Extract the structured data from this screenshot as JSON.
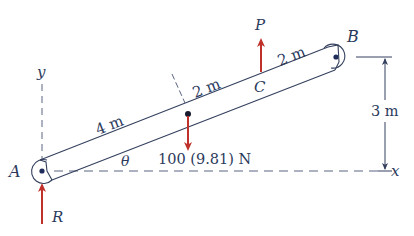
{
  "diagram": {
    "type": "free-body / statics problem figure",
    "colors": {
      "line": "#34405e",
      "force": "#c0312b",
      "dashed": "#5a6480",
      "background": "#ffffff"
    },
    "points": {
      "A": "A",
      "B": "B",
      "C": "C"
    },
    "axes": {
      "x": "x",
      "y": "y"
    },
    "angle": "θ",
    "dimensions": {
      "segment_1": "4 m",
      "segment_2": "2 m",
      "segment_3": "2 m",
      "height": "3 m"
    },
    "forces": {
      "P": "P",
      "R": "R",
      "weight": "100 (9.81) N"
    }
  }
}
